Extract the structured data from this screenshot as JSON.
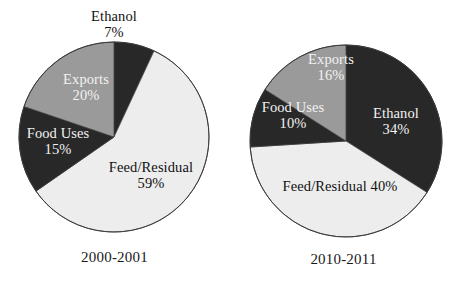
{
  "figure": {
    "title": "",
    "background": "#ffffff"
  },
  "palette": {
    "dark": "#282828",
    "gray": "#9a9a9a",
    "light": "#ededed",
    "outline": "#3a3a3a",
    "label_on_dark": "#f2f2f2",
    "label_on_light": "#111111"
  },
  "chart_data": [
    {
      "type": "pie",
      "title": "2000-2001",
      "categories": [
        "Ethanol",
        "Feed/Residual",
        "Food Uses",
        "Exports"
      ],
      "values": [
        7,
        59,
        15,
        20
      ],
      "value_labels": [
        "7%",
        "20%",
        "15%",
        "59%"
      ],
      "unit": "%",
      "start_angle_deg": 0,
      "direction": "clockwise",
      "legend": "none",
      "grid": false,
      "slices": [
        {
          "name": "Ethanol",
          "value": 7,
          "pct_label": "7%",
          "color": "#282828",
          "label_position": "outside-top",
          "label_color": "#111111"
        },
        {
          "name": "Feed/Residual",
          "value": 59,
          "pct_label": "59%",
          "color": "#ededed",
          "label_position": "inside",
          "label_color": "#111111"
        },
        {
          "name": "Food Uses",
          "value": 15,
          "pct_label": "15%",
          "color": "#282828",
          "label_position": "inside",
          "label_color": "#f2f2f2"
        },
        {
          "name": "Exports",
          "value": 20,
          "pct_label": "20%",
          "color": "#9a9a9a",
          "label_position": "inside",
          "label_color": "#f2f2f2"
        }
      ]
    },
    {
      "type": "pie",
      "title": "2010-2011",
      "categories": [
        "Ethanol",
        "Feed/Residual",
        "Food Uses",
        "Exports"
      ],
      "values": [
        34,
        40,
        10,
        16
      ],
      "value_labels": [
        "34%",
        "40%",
        "10%",
        "16%"
      ],
      "unit": "%",
      "start_angle_deg": 0,
      "direction": "clockwise",
      "legend": "none",
      "grid": false,
      "slices": [
        {
          "name": "Ethanol",
          "value": 34,
          "pct_label": "34%",
          "color": "#282828",
          "label_position": "inside",
          "label_color": "#111111"
        },
        {
          "name": "Feed/Residual",
          "value": 40,
          "pct_label": "40%",
          "color": "#ededed",
          "label_position": "inside",
          "label_color": "#111111"
        },
        {
          "name": "Food Uses",
          "value": 10,
          "pct_label": "10%",
          "color": "#282828",
          "label_position": "inside",
          "label_color": "#f2f2f2"
        },
        {
          "name": "Exports",
          "value": 16,
          "pct_label": "16%",
          "color": "#9a9a9a",
          "label_position": "inside",
          "label_color": "#f2f2f2"
        }
      ]
    }
  ],
  "left_chart": {
    "caption": "2000-2001",
    "labels": {
      "ethanol_name": "Ethanol",
      "ethanol_pct": "7%",
      "exports_name": "Exports",
      "exports_pct": "20%",
      "food_uses_name": "Food Uses",
      "food_uses_pct": "15%",
      "feed_residual_name": "Feed/Residual",
      "feed_residual_pct": "59%"
    }
  },
  "right_chart": {
    "caption": "2010-2011",
    "labels": {
      "ethanol_name": "Ethanol",
      "ethanol_pct": "34%",
      "exports_name": "Exports",
      "exports_pct": "16%",
      "food_uses_name": "Food Uses",
      "food_uses_pct": "10%",
      "feed_residual_name": "Feed/Residual",
      "feed_residual_pct": "40%"
    }
  }
}
